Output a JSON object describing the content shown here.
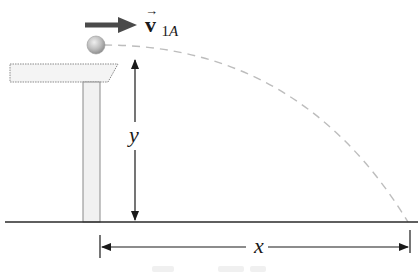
{
  "diagram": {
    "type": "projectile-from-table",
    "labels": {
      "velocity_symbol": "v",
      "velocity_subscript_num": "1",
      "velocity_subscript_letter": "A",
      "velocity_arrow": "→",
      "height": "y",
      "distance": "x"
    },
    "colors": {
      "line": "#2a2a2a",
      "velocity_arrow": "#4a4a4a",
      "trajectory": "#bdbdbd",
      "table_fill": "#f4f4f4",
      "table_stroke": "#8a8a8a",
      "ball": "#b8b8b8"
    },
    "elements": [
      "ball",
      "velocity-vector",
      "table",
      "table-leg",
      "ground",
      "height-dimension",
      "range-dimension",
      "trajectory"
    ]
  }
}
